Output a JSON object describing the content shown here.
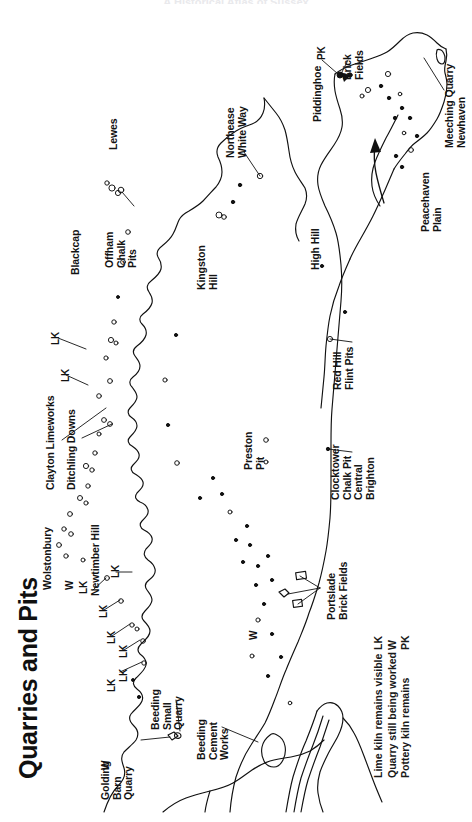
{
  "header": {
    "cut_off_title": "A Historical Atlas of Sussex"
  },
  "title": "Quarries and Pits",
  "legend": {
    "entries": [
      {
        "code": "LK",
        "description": "Lime kiln remains visible"
      },
      {
        "code": "W",
        "description": "Quarry still being worked"
      },
      {
        "code": "PK",
        "description": "Pottery kiln remains"
      }
    ]
  },
  "map": {
    "place_labels": [
      {
        "id": "lewes",
        "text": "Lewes"
      },
      {
        "id": "blackcap",
        "text": "Blackcap"
      },
      {
        "id": "offham-chalk-pits",
        "text": "Offham\nChalk\nPits"
      },
      {
        "id": "clayton-limeworks",
        "text": "Clayton Limeworks"
      },
      {
        "id": "ditchling-downs",
        "text": "Ditchling Downs"
      },
      {
        "id": "wolstonbury",
        "text": "Wolstonbury"
      },
      {
        "id": "newtimber-hill",
        "text": "Newtimber Hill"
      },
      {
        "id": "golding-barn-quarry",
        "text": "Golding\nBarn\nQuarry"
      },
      {
        "id": "beeding-small-quarry",
        "text": "Beeding\nSmall\nQuarry"
      },
      {
        "id": "beeding-cement-works",
        "text": "Beeding\nCement\nWorks"
      },
      {
        "id": "preston-pit",
        "text": "Preston\nPit"
      },
      {
        "id": "portslade-brick-fields",
        "text": "Portslade\nBrick Fields"
      },
      {
        "id": "clocktower-chalk-pit",
        "text": "Clocktower\nChalk Pit\nCentral\nBrighton"
      },
      {
        "id": "red-hill-flint-pits",
        "text": "Red Hill\nFlint Pits"
      },
      {
        "id": "kingston-hill",
        "text": "Kingston\nHill"
      },
      {
        "id": "northease-white-way",
        "text": "Northease\nWhite Way"
      },
      {
        "id": "high-hill",
        "text": "High Hill"
      },
      {
        "id": "piddinghoe",
        "text": "Piddinghoe"
      },
      {
        "id": "brick-fields",
        "text": "Brick\nFields"
      },
      {
        "id": "peacehaven-plain",
        "text": "Peacehaven\nPlain"
      },
      {
        "id": "meeching-quarry",
        "text": "Meeching Quarry\nNewhaven"
      }
    ],
    "code_markers": [
      {
        "id": "pk-piddinghoe",
        "text": "PK"
      },
      {
        "id": "lk-ditchling-a",
        "text": "LK"
      },
      {
        "id": "lk-ditchling-b",
        "text": "LK"
      },
      {
        "id": "lk-newtimber",
        "text": "LK"
      },
      {
        "id": "w-newtimber",
        "text": "W"
      },
      {
        "id": "lk-newtimber-2",
        "text": "LK"
      },
      {
        "id": "lk-downs-a",
        "text": "LK"
      },
      {
        "id": "lk-downs-b",
        "text": "LK"
      },
      {
        "id": "lk-downs-c",
        "text": "LK"
      },
      {
        "id": "lk-downs-d",
        "text": "LK"
      },
      {
        "id": "lk-downs-e",
        "text": "LK"
      },
      {
        "id": "w-golding",
        "text": "W"
      },
      {
        "id": "w-portslade",
        "text": "W"
      }
    ]
  }
}
